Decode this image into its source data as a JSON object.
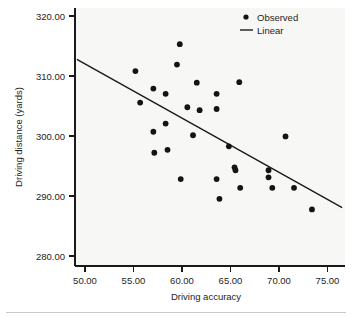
{
  "chart_data": {
    "type": "scatter",
    "title": "",
    "xlabel": "Driving accuracy",
    "ylabel": "Driving distance (yards)",
    "xlim": [
      48.4,
      77.0
    ],
    "ylim": [
      277.3,
      321.5
    ],
    "xticks": [
      50,
      55,
      60,
      65,
      70,
      75
    ],
    "xtick_labels": [
      "50.00",
      "55.00",
      "60.00",
      "65.00",
      "70.00",
      "75.00"
    ],
    "yticks": [
      280,
      290,
      300,
      310,
      320
    ],
    "ytick_labels": [
      "280.00",
      "290.00",
      "300.00",
      "310.00",
      "320.00"
    ],
    "grid": false,
    "legend_position": "top-right",
    "legend": [
      {
        "label": "Observed",
        "marker": "dot",
        "color": "#141414"
      },
      {
        "label": "Linear",
        "marker": "line",
        "color": "#1a1a1a"
      }
    ],
    "series": [
      {
        "name": "Observed",
        "marker": "dot",
        "color": "#141414",
        "points": [
          {
            "x": 54.8,
            "y": 310.7
          },
          {
            "x": 55.3,
            "y": 305.3
          },
          {
            "x": 56.7,
            "y": 307.7
          },
          {
            "x": 56.7,
            "y": 300.3
          },
          {
            "x": 56.8,
            "y": 296.7
          },
          {
            "x": 58.0,
            "y": 306.8
          },
          {
            "x": 58.0,
            "y": 301.7
          },
          {
            "x": 58.2,
            "y": 297.2
          },
          {
            "x": 59.5,
            "y": 315.3
          },
          {
            "x": 59.2,
            "y": 311.8
          },
          {
            "x": 59.6,
            "y": 292.2
          },
          {
            "x": 60.3,
            "y": 304.5
          },
          {
            "x": 61.3,
            "y": 308.7
          },
          {
            "x": 60.9,
            "y": 299.7
          },
          {
            "x": 61.6,
            "y": 304.0
          },
          {
            "x": 63.4,
            "y": 304.2
          },
          {
            "x": 63.4,
            "y": 306.8
          },
          {
            "x": 63.4,
            "y": 292.2
          },
          {
            "x": 63.7,
            "y": 288.8
          },
          {
            "x": 64.7,
            "y": 297.8
          },
          {
            "x": 65.3,
            "y": 294.2
          },
          {
            "x": 65.4,
            "y": 293.7
          },
          {
            "x": 65.8,
            "y": 308.8
          },
          {
            "x": 65.9,
            "y": 290.7
          },
          {
            "x": 68.9,
            "y": 293.7
          },
          {
            "x": 68.9,
            "y": 292.5
          },
          {
            "x": 69.3,
            "y": 290.7
          },
          {
            "x": 70.7,
            "y": 299.5
          },
          {
            "x": 71.6,
            "y": 290.7
          },
          {
            "x": 73.5,
            "y": 287.0
          }
        ]
      },
      {
        "name": "Linear",
        "marker": "line",
        "color": "#1a1a1a",
        "line_endpoints": [
          {
            "x": 48.6,
            "y": 312.7
          },
          {
            "x": 76.7,
            "y": 287.3
          }
        ]
      }
    ]
  },
  "legend": {
    "observed_label": "Observed",
    "linear_label": "Linear"
  },
  "axes": {
    "x_title": "Driving accuracy",
    "y_title": "Driving distance (yards)"
  }
}
